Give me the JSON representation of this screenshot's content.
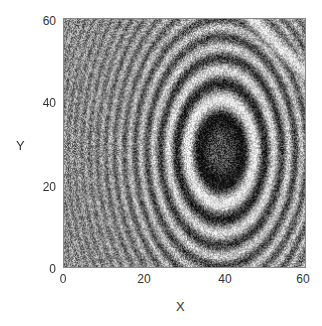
{
  "chart_data": {
    "type": "heatmap",
    "title": "",
    "xlabel": "X",
    "ylabel": "Y",
    "xlim": [
      0,
      60
    ],
    "ylim": [
      0,
      60
    ],
    "xticks": [
      "0",
      "20",
      "40",
      "60"
    ],
    "yticks": [
      "0",
      "20",
      "40",
      "60"
    ],
    "colormap": "gray",
    "grid": false,
    "features": {
      "center": [
        39,
        28
      ],
      "core_semi_axes": [
        6,
        9
      ],
      "ring_spacing_near_core": 5,
      "bright_streak_top_right": {
        "from": [
          47,
          60
        ],
        "to": [
          60,
          47
        ]
      }
    }
  },
  "colors": {
    "background": "#ffffff",
    "axis": "#888888",
    "text": "#333333"
  }
}
